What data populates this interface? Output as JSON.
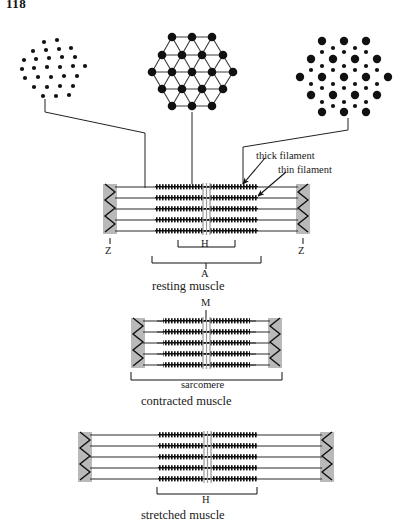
{
  "page": {
    "number": "118"
  },
  "figure": {
    "colors": {
      "ink": "#1a1a1a",
      "zdisc_fill": "#b9b9b9",
      "thick_filament": "#1a1a1a",
      "thin_filament": "#2a2a2a",
      "mline": "#9a9a9a",
      "background": "#ffffff"
    }
  },
  "cross_sections": {
    "left": {
      "name": "thin-filaments-only-cross-section",
      "description": "I-band region: small thin filaments only",
      "dot_sizes": [
        "small"
      ],
      "lattice": "hexagonal"
    },
    "middle": {
      "name": "thick-filaments-only-cross-section",
      "description": "H-zone region: large thick filaments joined by lattice lines",
      "dot_sizes": [
        "large"
      ],
      "lattice": "hexagonal-with-links"
    },
    "right": {
      "name": "overlap-cross-section",
      "description": "Overlap region: thick filaments surrounded by thin filaments",
      "dot_sizes": [
        "large",
        "small"
      ],
      "lattice": "hexagonal"
    }
  },
  "callouts": {
    "thick_filament": "thick filament",
    "thin_filament": "thin filament"
  },
  "panels": [
    {
      "id": "resting",
      "caption": "resting muscle",
      "labels": {
        "z_left": "Z",
        "z_right": "Z",
        "h_band": "H",
        "a_band": "A"
      },
      "rows": 5
    },
    {
      "id": "contracted",
      "caption": "contracted muscle",
      "labels": {
        "m_line": "M",
        "sarcomere": "sarcomere"
      },
      "rows": 5
    },
    {
      "id": "stretched",
      "caption": "stretched muscle",
      "labels": {
        "h_band": "H"
      },
      "rows": 5
    }
  ]
}
